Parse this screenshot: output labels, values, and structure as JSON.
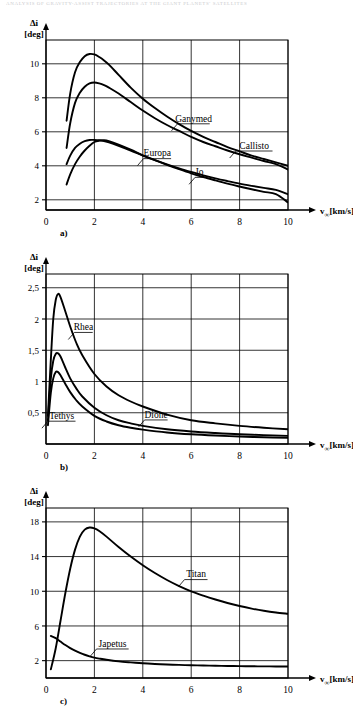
{
  "running_head": "ANALYSIS OF GRAVITY-ASSIST TRAJECTORIES AT THE GIANT PLANETS' SATELLITES",
  "axis": {
    "y_symbol": "Δi",
    "y_unit": "[deg]",
    "x_symbol": "v",
    "x_subscript": "∞",
    "x_unit": "[km/s]"
  },
  "panels": [
    {
      "key": "a",
      "caption": "a)",
      "chart_data": {
        "type": "line",
        "title": "",
        "xlabel": "v∞[km/s]",
        "ylabel": "Δi [deg]",
        "xlim": [
          0,
          10
        ],
        "ylim": [
          1.4,
          11.4
        ],
        "xticks": [
          0,
          2,
          4,
          6,
          8,
          10
        ],
        "yticks": [
          2,
          4,
          6,
          8,
          10
        ],
        "ytick_labels": [
          "2",
          "4",
          "6",
          "8",
          "10"
        ],
        "xtick_labels": [
          "0",
          "2",
          "4",
          "6",
          "8",
          "10"
        ],
        "grid": true,
        "legend": "inline-annotations",
        "x": [
          0.85,
          1.0,
          1.2,
          1.4,
          1.6,
          1.8,
          2.0,
          2.2,
          2.4,
          2.6,
          3.0,
          3.5,
          4.0,
          4.5,
          5.0,
          5.5,
          6.0,
          6.5,
          7.0,
          7.5,
          8.0,
          8.5,
          9.0,
          9.5,
          10.0
        ],
        "series": [
          {
            "name": "Ganymed",
            "label_x": 6.1,
            "label_y": 6.6,
            "values": [
              6.65,
              8.25,
              9.5,
              10.1,
              10.45,
              10.58,
              10.55,
              10.4,
              10.2,
              9.95,
              9.35,
              8.6,
              7.95,
              7.4,
              6.9,
              6.45,
              6.05,
              5.7,
              5.4,
              5.1,
              4.85,
              4.6,
              4.4,
              4.2,
              4.0
            ]
          },
          {
            "name": "Callisto",
            "label_x": 8.6,
            "label_y": 5.0,
            "values": [
              5.05,
              6.5,
              7.7,
              8.3,
              8.65,
              8.85,
              8.9,
              8.85,
              8.75,
              8.6,
              8.25,
              7.75,
              7.25,
              6.8,
              6.4,
              6.05,
              5.7,
              5.4,
              5.15,
              4.9,
              4.68,
              4.48,
              4.28,
              4.1,
              3.78
            ]
          },
          {
            "name": "Europa",
            "label_x": 4.6,
            "label_y": 4.55,
            "values": [
              4.1,
              4.6,
              5.05,
              5.3,
              5.45,
              5.52,
              5.52,
              5.5,
              5.45,
              5.38,
              5.18,
              4.9,
              4.6,
              4.33,
              4.08,
              3.85,
              3.64,
              3.44,
              3.26,
              3.1,
              2.95,
              2.82,
              2.7,
              2.58,
              2.32
            ]
          },
          {
            "name": "Io",
            "label_x": 6.35,
            "label_y": 3.45,
            "values": [
              2.9,
              3.5,
              4.1,
              4.55,
              4.9,
              5.18,
              5.4,
              5.48,
              5.5,
              5.45,
              5.25,
              4.95,
              4.62,
              4.33,
              4.05,
              3.8,
              3.56,
              3.34,
              3.14,
              2.95,
              2.78,
              2.62,
              2.47,
              2.33,
              1.85
            ]
          }
        ]
      }
    },
    {
      "key": "b",
      "caption": "b)",
      "chart_data": {
        "type": "line",
        "title": "",
        "xlabel": "v∞[km/s]",
        "ylabel": "Δi [deg]",
        "xlim": [
          0,
          10
        ],
        "ylim": [
          0,
          2.72
        ],
        "xticks": [
          0,
          2,
          4,
          6,
          8,
          10
        ],
        "yticks": [
          0.5,
          1,
          1.5,
          2,
          2.5
        ],
        "ytick_labels": [
          "0,5",
          "1",
          "1,5",
          "2",
          "2,5"
        ],
        "xtick_labels": [
          "0",
          "2",
          "4",
          "6",
          "8",
          "10"
        ],
        "grid": true,
        "legend": "inline-annotations",
        "x": [
          0.08,
          0.2,
          0.3,
          0.4,
          0.5,
          0.6,
          0.8,
          1.0,
          1.25,
          1.5,
          2.0,
          2.5,
          3.0,
          3.5,
          4.0,
          5.0,
          6.0,
          7.0,
          8.0,
          9.0,
          10.0
        ],
        "series": [
          {
            "name": "Rhea",
            "label_x": 1.55,
            "label_y": 1.82,
            "values": [
              0.45,
              1.35,
              2.0,
              2.3,
              2.4,
              2.35,
              2.12,
              1.88,
              1.62,
              1.42,
              1.12,
              0.92,
              0.78,
              0.68,
              0.6,
              0.47,
              0.38,
              0.33,
              0.29,
              0.26,
              0.235
            ]
          },
          {
            "name": "Dione",
            "label_x": 4.55,
            "label_y": 0.42,
            "values": [
              0.38,
              1.05,
              1.33,
              1.44,
              1.45,
              1.4,
              1.22,
              1.05,
              0.89,
              0.76,
              0.58,
              0.46,
              0.38,
              0.33,
              0.29,
              0.235,
              0.2,
              0.175,
              0.155,
              0.142,
              0.13
            ]
          },
          {
            "name": "Tethys",
            "label_x": 0.65,
            "label_y": 0.4,
            "values": [
              0.3,
              0.82,
              1.05,
              1.15,
              1.15,
              1.1,
              0.96,
              0.83,
              0.7,
              0.6,
              0.45,
              0.36,
              0.3,
              0.26,
              0.23,
              0.185,
              0.155,
              0.135,
              0.12,
              0.108,
              0.1
            ]
          }
        ]
      }
    },
    {
      "key": "c",
      "caption": "c)",
      "chart_data": {
        "type": "line",
        "title": "",
        "xlabel": "v∞[km/s]",
        "ylabel": "Δi [deg]",
        "xlim": [
          0,
          10
        ],
        "ylim": [
          0,
          19.6
        ],
        "xticks": [
          0,
          2,
          4,
          6,
          8,
          10
        ],
        "yticks": [
          2,
          6,
          10,
          14,
          18
        ],
        "ytick_labels": [
          "2",
          "6",
          "10",
          "14",
          "18"
        ],
        "xtick_labels": [
          "0",
          "2",
          "4",
          "6",
          "8",
          "10"
        ],
        "grid": true,
        "legend": "inline-annotations",
        "x": [
          0.2,
          0.4,
          0.6,
          0.8,
          1.0,
          1.2,
          1.4,
          1.6,
          1.8,
          2.0,
          2.2,
          2.5,
          3.0,
          3.5,
          4.0,
          4.5,
          5.0,
          5.5,
          6.0,
          6.5,
          7.0,
          7.5,
          8.0,
          8.5,
          9.0,
          9.5,
          10.0
        ],
        "series": [
          {
            "name": "Titan",
            "label_x": 6.2,
            "label_y": 11.6,
            "values": [
              1.0,
              3.4,
              6.6,
              9.8,
              12.6,
              14.8,
              16.3,
              17.1,
              17.35,
              17.25,
              16.95,
              16.3,
              15.1,
              14.0,
              13.0,
              12.1,
              11.3,
              10.6,
              10.0,
              9.5,
              9.05,
              8.65,
              8.3,
              8.0,
              7.75,
              7.55,
              7.4
            ]
          },
          {
            "name": "Japetus",
            "label_x": 2.75,
            "label_y": 3.6,
            "values": [
              4.85,
              4.6,
              4.2,
              3.8,
              3.45,
              3.15,
              2.9,
              2.68,
              2.5,
              2.35,
              2.24,
              2.1,
              1.92,
              1.8,
              1.7,
              1.62,
              1.56,
              1.51,
              1.47,
              1.44,
              1.41,
              1.39,
              1.37,
              1.35,
              1.34,
              1.33,
              1.32
            ]
          }
        ]
      }
    }
  ]
}
